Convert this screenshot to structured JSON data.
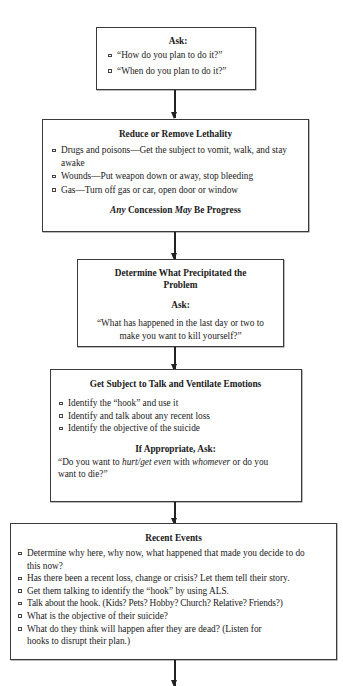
{
  "flowchart": {
    "box1": {
      "title": "Ask:",
      "items": [
        "“How do you plan to do it?”",
        "“When do you plan to do it?”"
      ]
    },
    "box2": {
      "title": "Reduce or Remove Lethality",
      "items": [
        "Drugs and poisons—Get the subject to vomit, walk, and stay awake",
        "Wounds—Put weapon down or away, stop bleeding",
        "Gas—Turn off gas or car, open door or window"
      ],
      "footer": {
        "part1_italic": "Any",
        "part2": " Concession ",
        "part3_italic": "May",
        "part4": " Be Progress"
      }
    },
    "box3": {
      "title": "Determine What Precipitated the Problem",
      "subtitle": "Ask:",
      "question": "“What has happened in the last day or two to make you want to kill yourself?”"
    },
    "box4": {
      "title": "Get Subject to Talk and Ventilate Emotions",
      "items": [
        "Identify the “hook” and use it",
        "Identify and talk about any recent loss",
        "Identify the objective of the suicide"
      ],
      "subtitle": "If Appropriate, Ask:",
      "question": {
        "part1": "“Do you want to ",
        "part2_italic": "hurt/get even",
        "part3": " with ",
        "part4_italic": "whomever",
        "part5": " or do you want to die?”"
      }
    },
    "box5": {
      "title": "Recent Events",
      "items": [
        "Determine why here, why now, what happened that made you decide to do this now?",
        "Has there been a recent loss, change or crisis? Let them tell their story.",
        "Get them talking to identify the “hook” by using ALS.",
        "Talk about the hook. (Kids? Pets? Hobby? Church? Relative? Friends?)",
        "What is the objective of their suicide?",
        "What do they think will happen after they are dead? (Listen for hooks to disrupt their plan.)"
      ]
    }
  },
  "colors": {
    "border": "#3a3a3a",
    "text": "#1a1a1a",
    "arrow": "#222222",
    "background": "#ffffff"
  }
}
